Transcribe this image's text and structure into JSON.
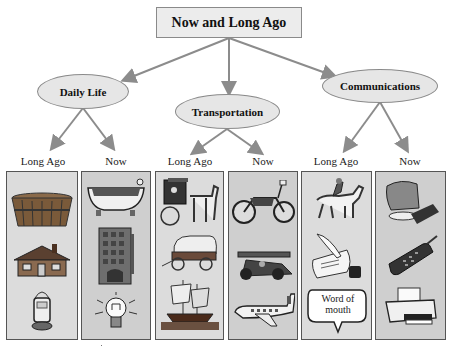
{
  "title": "Now and Long Ago",
  "categories": [
    {
      "name": "Daily Life",
      "long_ago_label": "Long Ago",
      "now_label": "Now",
      "long_ago_items": [
        "wooden-tub",
        "log-cabin",
        "oil-lantern"
      ],
      "now_items": [
        "bathtub",
        "apartment-building",
        "light-bulb"
      ]
    },
    {
      "name": "Transportation",
      "long_ago_label": "Long Ago",
      "now_label": "Now",
      "long_ago_items": [
        "horse-and-buggy",
        "covered-wagon",
        "sailing-ship"
      ],
      "now_items": [
        "motorcycle",
        "race-car",
        "airplane"
      ]
    },
    {
      "name": "Communications",
      "long_ago_label": "Long Ago",
      "now_label": "Now",
      "long_ago_items": [
        "horse-rider",
        "quill-and-scroll",
        "word-of-mouth-bubble"
      ],
      "now_items": [
        "computer",
        "cell-phone",
        "printer"
      ]
    }
  ],
  "speech_bubble_text": "Word of mouth",
  "colors": {
    "line": "#8c8c8c",
    "box_fill": "#ececec",
    "ellipse_fill": "#e6e6e6",
    "panel_long_ago": "#dcdcdc",
    "panel_now": "#cfcfcf",
    "panel_border": "#555555"
  }
}
